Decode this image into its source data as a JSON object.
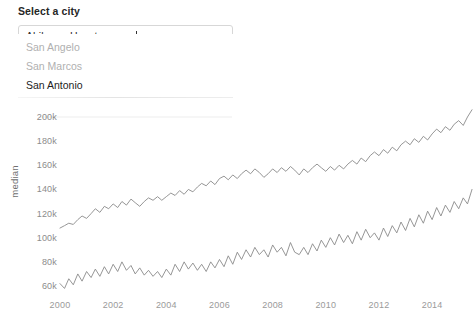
{
  "widget": {
    "label": "Select a city",
    "tags": [
      "Abilene",
      "Houston"
    ],
    "typed_text": "san",
    "placeholder": "Select a city",
    "dropdown_options": [
      {
        "label": "San Angelo",
        "active": false
      },
      {
        "label": "San Marcos",
        "active": false
      },
      {
        "label": "San Antonio",
        "active": true
      }
    ]
  },
  "chart_data": {
    "type": "line",
    "title": "",
    "xlabel": "",
    "ylabel": "median",
    "xlim": [
      1999.6,
      2015.6
    ],
    "ylim": [
      52000,
      212000
    ],
    "xticks": [
      2000,
      2002,
      2004,
      2006,
      2008,
      2010,
      2012,
      2014
    ],
    "xtick_labels": [
      "2000",
      "2002",
      "2004",
      "2006",
      "2008",
      "2010",
      "2012",
      "2014"
    ],
    "yticks": [
      60000,
      80000,
      100000,
      120000,
      140000,
      160000,
      180000,
      200000
    ],
    "ytick_labels": [
      "60k",
      "80k",
      "100k",
      "120k",
      "140k",
      "160k",
      "180k",
      "200k"
    ],
    "grid": false,
    "legend": "none",
    "line_color": "#8a8a8a",
    "line_width": 0.9,
    "series": [
      {
        "name": "Houston",
        "color": "#8a8a8a",
        "x": [
          2000.0,
          2000.17,
          2000.33,
          2000.5,
          2000.67,
          2000.83,
          2001.0,
          2001.17,
          2001.33,
          2001.5,
          2001.67,
          2001.83,
          2002.0,
          2002.17,
          2002.33,
          2002.5,
          2002.67,
          2002.83,
          2003.0,
          2003.17,
          2003.33,
          2003.5,
          2003.67,
          2003.83,
          2004.0,
          2004.17,
          2004.33,
          2004.5,
          2004.67,
          2004.83,
          2005.0,
          2005.17,
          2005.33,
          2005.5,
          2005.67,
          2005.83,
          2006.0,
          2006.17,
          2006.33,
          2006.5,
          2006.67,
          2006.83,
          2007.0,
          2007.17,
          2007.33,
          2007.5,
          2007.67,
          2007.83,
          2008.0,
          2008.17,
          2008.33,
          2008.5,
          2008.67,
          2008.83,
          2009.0,
          2009.17,
          2009.33,
          2009.5,
          2009.67,
          2009.83,
          2010.0,
          2010.17,
          2010.33,
          2010.5,
          2010.67,
          2010.83,
          2011.0,
          2011.17,
          2011.33,
          2011.5,
          2011.67,
          2011.83,
          2012.0,
          2012.17,
          2012.33,
          2012.5,
          2012.67,
          2012.83,
          2013.0,
          2013.17,
          2013.33,
          2013.5,
          2013.67,
          2013.83,
          2014.0,
          2014.17,
          2014.33,
          2014.5,
          2014.67,
          2014.83,
          2015.0,
          2015.17,
          2015.33,
          2015.5
        ],
        "y": [
          108000,
          110000,
          112000,
          111000,
          115000,
          118000,
          116000,
          120000,
          124000,
          121000,
          126000,
          124000,
          128000,
          125000,
          130000,
          127000,
          132000,
          129000,
          126000,
          130000,
          133000,
          131000,
          134000,
          131000,
          134000,
          137000,
          135000,
          139000,
          136000,
          140000,
          138000,
          142000,
          145000,
          143000,
          147000,
          144000,
          149000,
          151000,
          148000,
          152000,
          149000,
          153000,
          156000,
          153000,
          157000,
          154000,
          150000,
          153000,
          157000,
          154000,
          158000,
          155000,
          159000,
          156000,
          152000,
          157000,
          154000,
          158000,
          161000,
          158000,
          155000,
          159000,
          156000,
          160000,
          157000,
          161000,
          164000,
          161000,
          166000,
          163000,
          168000,
          171000,
          168000,
          173000,
          170000,
          175000,
          172000,
          177000,
          180000,
          177000,
          182000,
          179000,
          184000,
          181000,
          186000,
          190000,
          187000,
          192000,
          189000,
          194000,
          197000,
          193000,
          200000,
          206000
        ]
      },
      {
        "name": "Abilene",
        "color": "#8a8a8a",
        "x": [
          2000.0,
          2000.17,
          2000.33,
          2000.5,
          2000.67,
          2000.83,
          2001.0,
          2001.17,
          2001.33,
          2001.5,
          2001.67,
          2001.83,
          2002.0,
          2002.17,
          2002.33,
          2002.5,
          2002.67,
          2002.83,
          2003.0,
          2003.17,
          2003.33,
          2003.5,
          2003.67,
          2003.83,
          2004.0,
          2004.17,
          2004.33,
          2004.5,
          2004.67,
          2004.83,
          2005.0,
          2005.17,
          2005.33,
          2005.5,
          2005.67,
          2005.83,
          2006.0,
          2006.17,
          2006.33,
          2006.5,
          2006.67,
          2006.83,
          2007.0,
          2007.17,
          2007.33,
          2007.5,
          2007.67,
          2007.83,
          2008.0,
          2008.17,
          2008.33,
          2008.5,
          2008.67,
          2008.83,
          2009.0,
          2009.17,
          2009.33,
          2009.5,
          2009.67,
          2009.83,
          2010.0,
          2010.17,
          2010.33,
          2010.5,
          2010.67,
          2010.83,
          2011.0,
          2011.17,
          2011.33,
          2011.5,
          2011.67,
          2011.83,
          2012.0,
          2012.17,
          2012.33,
          2012.5,
          2012.67,
          2012.83,
          2013.0,
          2013.17,
          2013.33,
          2013.5,
          2013.67,
          2013.83,
          2014.0,
          2014.17,
          2014.33,
          2014.5,
          2014.67,
          2014.83,
          2015.0,
          2015.17,
          2015.33,
          2015.5
        ],
        "y": [
          62000,
          58000,
          66000,
          61000,
          70000,
          64000,
          72000,
          67000,
          74000,
          68000,
          76000,
          70000,
          78000,
          72000,
          80000,
          73000,
          77000,
          70000,
          75000,
          69000,
          73000,
          68000,
          72000,
          67000,
          74000,
          69000,
          78000,
          72000,
          80000,
          74000,
          79000,
          73000,
          78000,
          72000,
          80000,
          75000,
          82000,
          76000,
          85000,
          78000,
          88000,
          82000,
          90000,
          84000,
          92000,
          86000,
          90000,
          84000,
          94000,
          88000,
          92000,
          85000,
          96000,
          88000,
          86000,
          92000,
          86000,
          95000,
          89000,
          98000,
          92000,
          100000,
          94000,
          103000,
          96000,
          102000,
          95000,
          105000,
          98000,
          107000,
          100000,
          104000,
          98000,
          108000,
          101000,
          110000,
          104000,
          113000,
          106000,
          116000,
          109000,
          119000,
          112000,
          122000,
          115000,
          125000,
          118000,
          127000,
          121000,
          130000,
          124000,
          133000,
          128000,
          140000
        ]
      }
    ]
  }
}
